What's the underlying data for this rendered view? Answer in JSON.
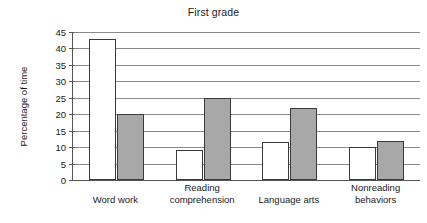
{
  "chart_data": {
    "type": "bar",
    "title": "First grade",
    "xlabel": "",
    "ylabel": "Percentage of time",
    "ylim": [
      0,
      45
    ],
    "ytick_step": 5,
    "yticks": [
      45,
      40,
      35,
      30,
      25,
      20,
      15,
      10,
      5,
      0
    ],
    "grid": true,
    "legend": "none",
    "categories": [
      "Word work",
      "Reading comprehension",
      "Language arts",
      "Nonreading behaviors"
    ],
    "category_lines": [
      [
        "Word work",
        ""
      ],
      [
        "Reading",
        "comprehension"
      ],
      [
        "Language arts",
        ""
      ],
      [
        "Nonreading",
        "behaviors"
      ]
    ],
    "series": [
      {
        "name": "white",
        "color": "#ffffff",
        "values": [
          43,
          9,
          11.5,
          10
        ]
      },
      {
        "name": "gray",
        "color": "#a8a8a8",
        "values": [
          20,
          25,
          22,
          12
        ]
      }
    ]
  },
  "colors": {
    "series_white": "#ffffff",
    "series_gray": "#a8a8a8",
    "bar_outline": "#3a3a3a",
    "gridline": "#8a8a8a",
    "axis": "#555555",
    "text": "#1a1a1a",
    "background": "#ffffff"
  }
}
